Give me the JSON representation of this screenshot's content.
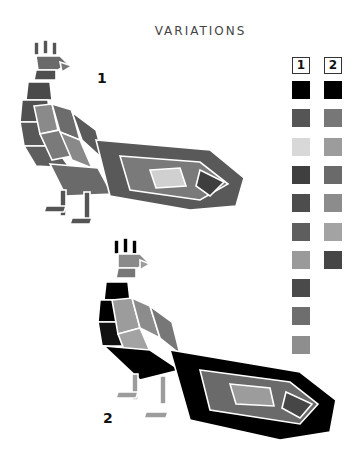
{
  "title": "VARIATIONS",
  "variations": [
    {
      "label": "1",
      "x": 97,
      "y": 70
    },
    {
      "label": "2",
      "x": 103,
      "y": 410
    }
  ],
  "palette": {
    "columns": [
      {
        "label": "1",
        "colors": [
          "#000000",
          "#555555",
          "#d8d8d8",
          "#3f3f3f",
          "#4d4d4d",
          "#5e5e5e",
          "#9a9a9a",
          "#4a4a4a",
          "#6e6e6e",
          "#8e8e8e"
        ]
      },
      {
        "label": "2",
        "colors": [
          "#000000",
          "#777777",
          "#9c9c9c",
          "#6a6a6a",
          "#8c8c8c",
          "#a3a3a3",
          "#464646"
        ]
      }
    ]
  }
}
